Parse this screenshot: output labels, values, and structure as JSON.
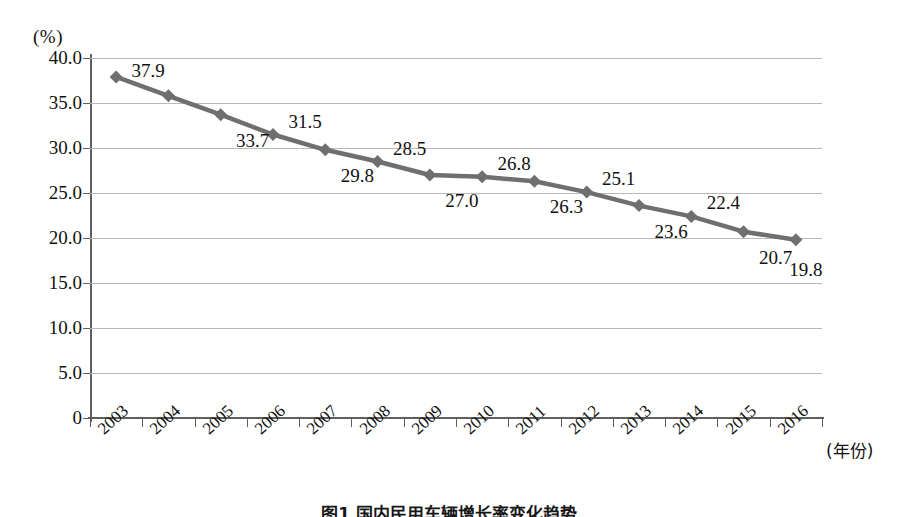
{
  "chart_data": {
    "type": "line",
    "title": "",
    "xlabel": "(年份)",
    "ylabel": "(%)",
    "categories": [
      "2003",
      "2004",
      "2005",
      "2006",
      "2007",
      "2008",
      "2009",
      "2010",
      "2011",
      "2012",
      "2013",
      "2014",
      "2015",
      "2016"
    ],
    "values": [
      37.9,
      35.8,
      33.7,
      31.5,
      29.8,
      28.5,
      27.0,
      26.8,
      26.3,
      25.1,
      23.6,
      22.4,
      20.7,
      19.8
    ],
    "point_labels": [
      "37.9",
      "",
      "33.7",
      "31.5",
      "29.8",
      "28.5",
      "27.0",
      "26.8",
      "26.3",
      "25.1",
      "23.6",
      "22.4",
      "20.7",
      "19.8"
    ],
    "label_positions": [
      "above",
      "none",
      "below",
      "above",
      "below",
      "above",
      "below",
      "above",
      "below",
      "above",
      "below",
      "above",
      "below",
      "below"
    ],
    "ylim": [
      0,
      40
    ],
    "yticks": [
      "0",
      "5.0",
      "10.0",
      "15.0",
      "20.0",
      "25.0",
      "30.0",
      "35.0",
      "40.0"
    ],
    "ytick_values": [
      0,
      5,
      10,
      15,
      20,
      25,
      30,
      35,
      40
    ],
    "grid": true,
    "legend": "none",
    "series_color": "#6f6f6f",
    "marker": "diamond",
    "grid_color": "#b9b9b9",
    "axis_color": "#5f5f5f"
  },
  "caption": {
    "text": "图1 国内民用车辆增长率变化趋势",
    "visible": "partially-clipped"
  }
}
